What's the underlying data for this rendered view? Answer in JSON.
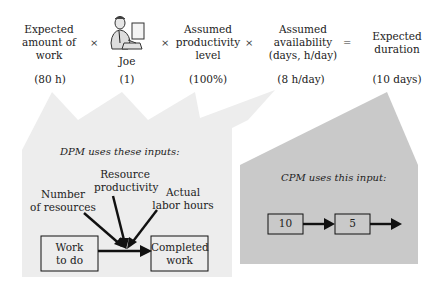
{
  "equation": {
    "terms": [
      {
        "label": "Expected\namount of\nwork",
        "value": "(80 h)"
      },
      {
        "label": "Joe",
        "value": "(1)",
        "icon": "person-at-computer-icon"
      },
      {
        "label": "Assumed\nproductivity\nlevel",
        "value": "(100%)"
      },
      {
        "label": "Assumed\navailability\n(days, h/day)",
        "value": "(8 h/day)"
      },
      {
        "label": "Expected\nduration",
        "value": "(10 days)"
      }
    ],
    "operators": [
      "×",
      "×",
      "×",
      "="
    ]
  },
  "dpm": {
    "title": "DPM uses these inputs:",
    "inputs": [
      "Number\nof resources",
      "Resource\nproductivity",
      "Actual\nlabor hours"
    ],
    "from_box": "Work\nto do",
    "to_box": "Completed\nwork"
  },
  "cpm": {
    "title": "CPM uses this input:",
    "nodes": [
      "10",
      "5"
    ]
  },
  "colors": {
    "light_callout": "#ececec",
    "dark_callout": "#c8c8c8",
    "ink": "#1a1a1a"
  }
}
